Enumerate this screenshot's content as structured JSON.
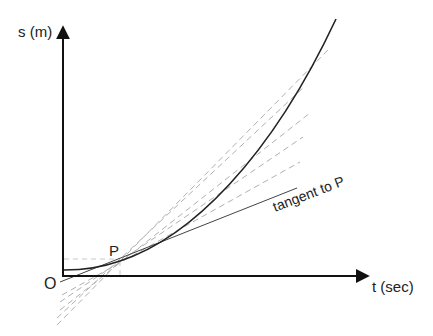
{
  "diagram": {
    "y_axis_label": "s (m)",
    "x_axis_label": "t (sec)",
    "origin_label": "O",
    "point_label": "P",
    "tangent_label": "tangent to P",
    "colors": {
      "axis": "#111111",
      "curve": "#222222",
      "tangent": "#444444",
      "secant": "#b0b0b0",
      "guide": "#c8c8c8"
    },
    "point_P": {
      "x": 120,
      "y": 261
    },
    "curve_end": {
      "x": 336,
      "y": 19
    },
    "secant_line_count": 5
  }
}
